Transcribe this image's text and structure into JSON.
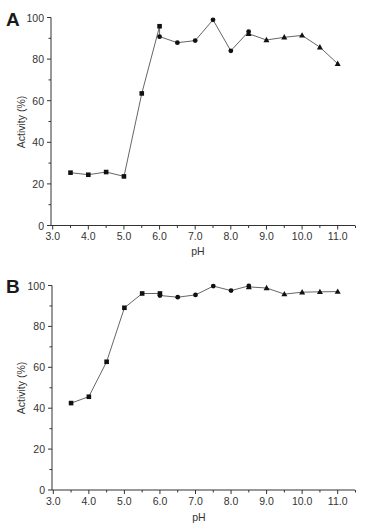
{
  "chart_data": [
    {
      "type": "line",
      "panel_label": "A",
      "title": "",
      "xlabel": "pH",
      "ylabel": "Activity (%)",
      "xlim": [
        3.0,
        11.5
      ],
      "ylim": [
        0,
        100
      ],
      "x_ticks": [
        "3.0",
        "4.0",
        "5.0",
        "6.0",
        "7.0",
        "8.0",
        "9.0",
        "10.0",
        "11.0"
      ],
      "y_ticks": [
        "0",
        "20",
        "40",
        "60",
        "80",
        "100"
      ],
      "grid": false,
      "legend": "none",
      "series": [
        {
          "name": "square-buffer",
          "marker": "square",
          "x": [
            3.5,
            4.0,
            4.5,
            5.0,
            5.5,
            6.0
          ],
          "y": [
            25.4,
            24.4,
            25.7,
            23.6,
            63.5,
            95.8
          ]
        },
        {
          "name": "circle-buffer",
          "marker": "circle",
          "x": [
            6.0,
            6.5,
            7.0,
            7.5,
            8.0,
            8.5
          ],
          "y": [
            90.8,
            87.9,
            88.9,
            98.9,
            84.0,
            93.2
          ]
        },
        {
          "name": "triangle-buffer",
          "marker": "triangle",
          "x": [
            8.5,
            9.0,
            9.5,
            10.0,
            10.5,
            11.0
          ],
          "y": [
            92.2,
            89.2,
            90.5,
            91.4,
            85.7,
            77.8
          ]
        }
      ]
    },
    {
      "type": "line",
      "panel_label": "B",
      "title": "",
      "xlabel": "pH",
      "ylabel": "Activity (%)",
      "xlim": [
        3.0,
        11.5
      ],
      "ylim": [
        0,
        100
      ],
      "x_ticks": [
        "3.0",
        "4.0",
        "5.0",
        "6.0",
        "7.0",
        "8.0",
        "9.0",
        "10.0",
        "11.0"
      ],
      "y_ticks": [
        "0",
        "20",
        "40",
        "60",
        "80",
        "100"
      ],
      "grid": false,
      "legend": "none",
      "series": [
        {
          "name": "square-buffer",
          "marker": "square",
          "x": [
            3.5,
            4.0,
            4.5,
            5.0,
            5.5,
            6.0
          ],
          "y": [
            42.5,
            45.6,
            62.7,
            89.1,
            96.1,
            96.1
          ]
        },
        {
          "name": "circle-buffer",
          "marker": "circle",
          "x": [
            6.0,
            6.5,
            7.0,
            7.5,
            8.0,
            8.5
          ],
          "y": [
            95.1,
            94.3,
            95.4,
            99.7,
            97.5,
            99.8
          ]
        },
        {
          "name": "triangle-buffer",
          "marker": "triangle",
          "x": [
            8.5,
            9.0,
            9.5,
            10.0,
            10.5,
            11.0
          ],
          "y": [
            99.3,
            98.8,
            95.8,
            96.7,
            96.9,
            97.0
          ]
        }
      ]
    }
  ]
}
